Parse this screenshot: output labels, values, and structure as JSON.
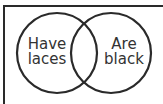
{
  "diagram": {
    "type": "venn",
    "sets": [
      {
        "label_line1": "Have",
        "label_line2": "laces"
      },
      {
        "label_line1": "Are",
        "label_line2": "black"
      }
    ],
    "colors": {
      "stroke": "#2a2a2a",
      "text": "#333333",
      "background": "#ffffff"
    }
  }
}
